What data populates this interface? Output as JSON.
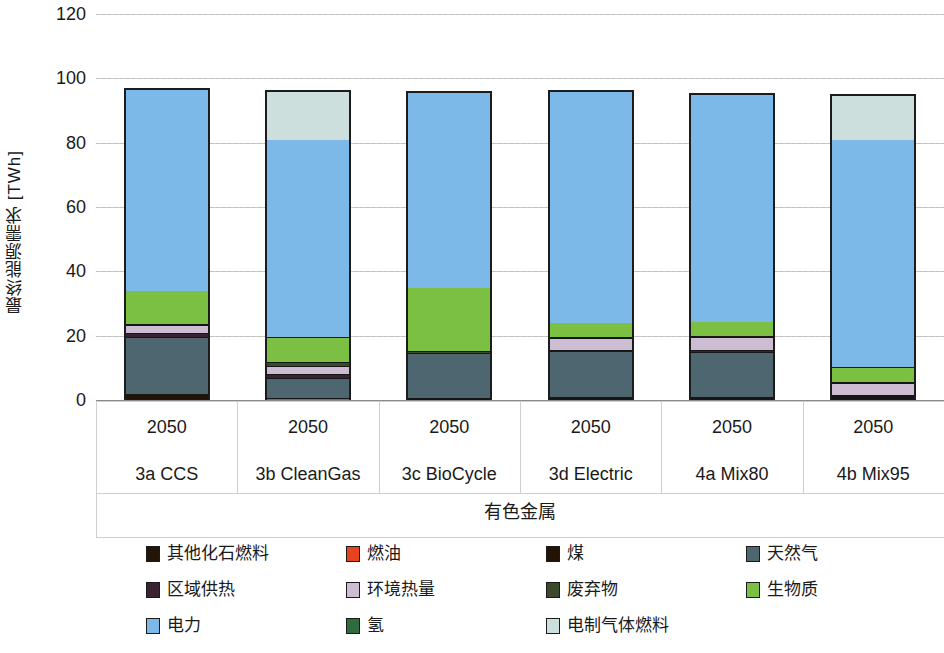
{
  "chart_data": {
    "type": "bar",
    "subtype": "stacked-bar",
    "title": "",
    "xlabel": "有色金属",
    "ylabel": "最终能源需求 [TWh]",
    "ylim": [
      0,
      120
    ],
    "yticks": [
      0,
      20,
      40,
      60,
      80,
      100,
      120
    ],
    "grid": true,
    "legend_position": "bottom",
    "categories": [
      "3a CCS",
      "3b CleanGas",
      "3c BioCycle",
      "3d Electric",
      "4a Mix80",
      "4b Mix95"
    ],
    "category_years": [
      "2050",
      "2050",
      "2050",
      "2050",
      "2050",
      "2050"
    ],
    "series": [
      {
        "name": "其他化石燃料",
        "color": "#221608",
        "values": [
          1.2,
          0.0,
          0.0,
          0.8,
          0.8,
          0.8
        ]
      },
      {
        "name": "燃油",
        "color": "#e8431f",
        "values": [
          0.0,
          1.0,
          0.0,
          0.0,
          0.0,
          0.0
        ]
      },
      {
        "name": "煤",
        "color": "#231305",
        "values": [
          1.0,
          0.0,
          1.0,
          0.5,
          0.5,
          0.7
        ]
      },
      {
        "name": "天然气",
        "color": "#4e6670",
        "values": [
          17.8,
          6.0,
          14.0,
          14.2,
          14.0,
          0.0
        ]
      },
      {
        "name": "区域供热",
        "color": "#3b2233",
        "values": [
          1.0,
          1.5,
          0.0,
          0.5,
          0.5,
          0.5
        ]
      },
      {
        "name": "环境热量",
        "color": "#cdbdd2",
        "values": [
          2.5,
          2.5,
          0.0,
          3.5,
          4.0,
          3.5
        ]
      },
      {
        "name": "废弃物",
        "color": "#3b4a2c",
        "values": [
          0.5,
          1.0,
          0.5,
          0.5,
          0.5,
          0.5
        ]
      },
      {
        "name": "生物质",
        "color": "#7cc043",
        "values": [
          10.5,
          8.0,
          20.0,
          4.5,
          4.5,
          4.5
        ]
      },
      {
        "name": "电力",
        "color": "#7cb9e8",
        "values": [
          62.5,
          61.5,
          60.5,
          72.0,
          70.5,
          71.0
        ]
      },
      {
        "name": "氢",
        "color": "#2f6b3c",
        "values": [
          0.0,
          0.0,
          0.0,
          0.0,
          0.0,
          0.0
        ]
      },
      {
        "name": "电制气体燃料",
        "color": "#ccdfdc",
        "values": [
          0.0,
          15.0,
          0.0,
          0.0,
          0.0,
          13.5
        ]
      }
    ],
    "bar_totals": [
      97.5,
      96.5,
      96.0,
      96.5,
      95.3,
      95.0
    ]
  },
  "axis": {
    "ylabel": "最终能源需求 [TWh]",
    "ticks": [
      "120",
      "100",
      "80",
      "60",
      "40",
      "20",
      "0"
    ],
    "group_label": "有色金属"
  },
  "legend": {
    "items": [
      {
        "label": "其他化石燃料",
        "color": "#221608"
      },
      {
        "label": "燃油",
        "color": "#e8431f"
      },
      {
        "label": "煤",
        "color": "#231305"
      },
      {
        "label": "天然气",
        "color": "#4e6670"
      },
      {
        "label": "区域供热",
        "color": "#3b2233"
      },
      {
        "label": "环境热量",
        "color": "#cdbdd2"
      },
      {
        "label": "废弃物",
        "color": "#3b4a2c"
      },
      {
        "label": "生物质",
        "color": "#7cc043"
      },
      {
        "label": "电力",
        "color": "#7cb9e8"
      },
      {
        "label": "氢",
        "color": "#2f6b3c"
      },
      {
        "label": "电制气体燃料",
        "color": "#ccdfdc"
      }
    ]
  }
}
